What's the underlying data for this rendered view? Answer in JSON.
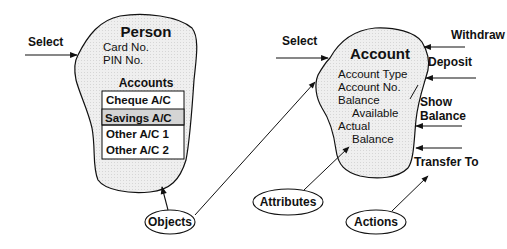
{
  "diagram": {
    "person": {
      "title": "Person",
      "fields": [
        "Card No.",
        "PIN No."
      ],
      "accounts_heading": "Accounts",
      "accounts": [
        "Cheque A/C",
        "Savings A/C",
        "Other A/C 1",
        "Other A/C 2"
      ],
      "highlighted_account_index": 1,
      "input_action": "Select"
    },
    "account": {
      "title": "Account",
      "fields": [
        "Account Type",
        "Account No.",
        "Balance",
        "Available",
        "Actual",
        "Balance"
      ],
      "input_action": "Select",
      "actions": [
        "Withdraw",
        "Deposit",
        "Show",
        "Balance",
        "Transfer To"
      ]
    },
    "legend": {
      "objects": "Objects",
      "attributes": "Attributes",
      "actions": "Actions"
    },
    "colors": {
      "blob_fill": "#ececec",
      "highlight_row": "#d4d4d4",
      "stroke": "#111111",
      "background": "#ffffff"
    }
  }
}
